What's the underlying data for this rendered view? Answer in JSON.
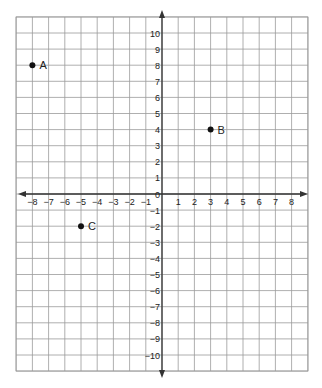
{
  "chart_data": {
    "type": "scatter",
    "title": "",
    "xlabel": "",
    "ylabel": "",
    "xlim": [
      -9,
      9
    ],
    "ylim": [
      -11,
      11
    ],
    "grid": true,
    "x_ticks": [
      -8,
      -7,
      -6,
      -5,
      -4,
      -3,
      -2,
      -1,
      1,
      2,
      3,
      4,
      5,
      6,
      7,
      8
    ],
    "y_ticks": [
      10,
      9,
      8,
      7,
      6,
      5,
      4,
      3,
      2,
      1,
      0,
      -1,
      -2,
      -3,
      -4,
      -5,
      -6,
      -7,
      -8,
      -9,
      -10
    ],
    "points": [
      {
        "label": "A",
        "x": -8,
        "y": 8
      },
      {
        "label": "B",
        "x": 3,
        "y": 4
      },
      {
        "label": "C",
        "x": -5,
        "y": -2
      }
    ],
    "colors": {
      "grid": "#9a9a9a",
      "axis": "#333333",
      "point": "#111111"
    }
  }
}
